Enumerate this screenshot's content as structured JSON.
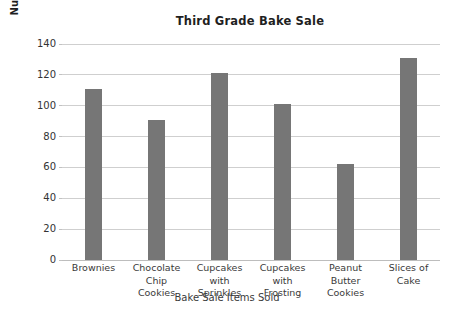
{
  "chart_data": {
    "type": "bar",
    "title": "Third Grade Bake Sale",
    "xlabel": "Bake Sale Items Sold",
    "ylabel": "Number of Items Sold",
    "categories": [
      "Brownies",
      "Chocolate Chip Cookies",
      "Cupcakes with Sprinkles",
      "Cupcakes with Frosting",
      "Peanut Butter Cookies",
      "Slices of Cake"
    ],
    "category_lines": [
      [
        "Brownies"
      ],
      [
        "Chocolate",
        "Chip",
        "Cookies"
      ],
      [
        "Cupcakes",
        "with",
        "Sprinkles"
      ],
      [
        "Cupcakes",
        "with",
        "Frosting"
      ],
      [
        "Peanut",
        "Butter",
        "Cookies"
      ],
      [
        "Slices of",
        "Cake"
      ]
    ],
    "values": [
      111,
      91,
      121,
      101,
      62,
      131
    ],
    "ylim": [
      0,
      140
    ],
    "ytick_step": 20,
    "yticks": [
      0,
      20,
      40,
      60,
      80,
      100,
      120,
      140
    ],
    "grid": true,
    "legend": false,
    "bar_color": "#767676",
    "gridline_color": "#cfcfcf",
    "text_color": "#2b2b2b",
    "background_color": "#ffffff"
  }
}
